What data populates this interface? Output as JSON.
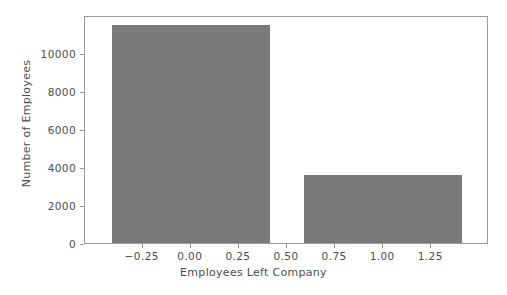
{
  "chart_data": {
    "type": "bar",
    "title": "",
    "xlabel": "Employees Left Company",
    "ylabel": "Number of Employees",
    "categories": [
      "0",
      "1"
    ],
    "x": [
      0,
      1
    ],
    "values": [
      11428,
      3571
    ],
    "bar_width": 0.82,
    "xlim": [
      -0.55,
      1.55
    ],
    "ylim": [
      0,
      11977
    ],
    "xticks": [
      -0.25,
      0.0,
      0.25,
      0.5,
      0.75,
      1.0,
      1.25
    ],
    "xtick_labels": [
      "−0.25",
      "0.00",
      "0.25",
      "0.50",
      "0.75",
      "1.00",
      "1.25"
    ],
    "yticks": [
      0,
      2000,
      4000,
      6000,
      8000,
      10000
    ],
    "ytick_labels": [
      "0",
      "2000",
      "4000",
      "6000",
      "8000",
      "10000"
    ],
    "grid": false,
    "legend": null,
    "bar_color": "#7a7a7a",
    "text_color": "#4d4d4d",
    "spine_color": "#9a9a9a",
    "background_color": "#ffffff"
  }
}
